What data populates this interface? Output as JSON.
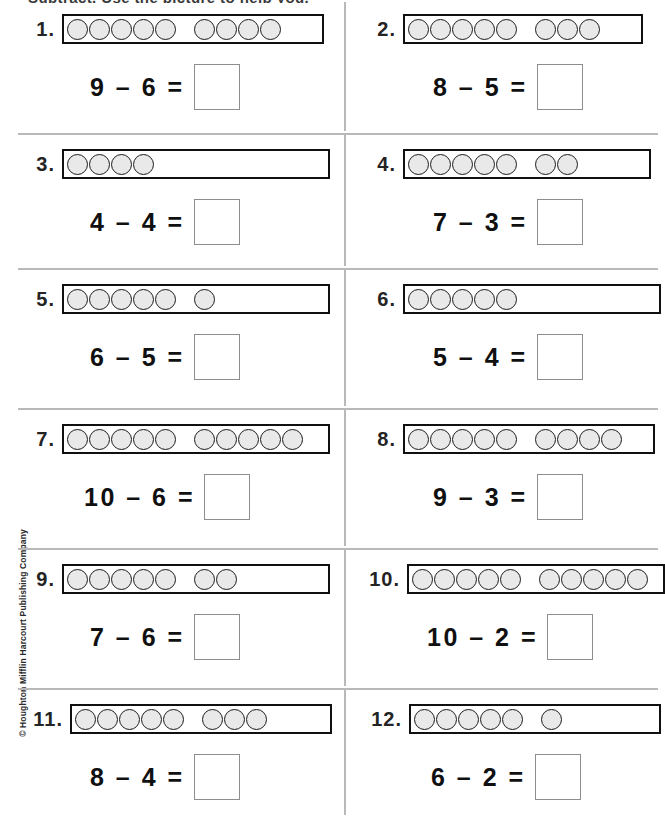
{
  "page": {
    "top_instruction_fragment": "Subtract. Use the picture to help you.",
    "copyright": "© Houghton Mifflin Harcourt Publishing Company",
    "colors": {
      "counter_fill": "#e9e9e9",
      "counter_stroke": "#1a1a1a",
      "strip_stroke": "#101010",
      "divider": "#b9b9b9",
      "answer_box_stroke": "#8d8d8d",
      "text": "#101010"
    }
  },
  "layout": {
    "columns": 2,
    "rows": 6,
    "row_divider_y": [
      133,
      268,
      408,
      548,
      688
    ],
    "column_divider_x": 344
  },
  "problems": [
    {
      "number": "1.",
      "strip_width": 262,
      "groups": [
        5,
        4
      ],
      "total_counters": 9,
      "equation": "9 – 6 =",
      "minuend": 9,
      "subtrahend": 6,
      "answer": "",
      "eq_left": 90,
      "strip_left": 18
    },
    {
      "number": "2.",
      "strip_width": 240,
      "groups": [
        5,
        3
      ],
      "total_counters": 8,
      "equation": "8 – 5 =",
      "minuend": 8,
      "subtrahend": 5,
      "answer": "",
      "eq_left": 88,
      "strip_left": 14
    },
    {
      "number": "3.",
      "strip_width": 268,
      "groups": [
        4
      ],
      "total_counters": 4,
      "equation": "4 – 4 =",
      "minuend": 4,
      "subtrahend": 4,
      "answer": "",
      "eq_left": 90,
      "strip_left": 18
    },
    {
      "number": "4.",
      "strip_width": 248,
      "groups": [
        5,
        2
      ],
      "total_counters": 7,
      "equation": "7 – 3 =",
      "minuend": 7,
      "subtrahend": 3,
      "answer": "",
      "eq_left": 88,
      "strip_left": 14
    },
    {
      "number": "5.",
      "strip_width": 268,
      "groups": [
        5,
        1
      ],
      "total_counters": 6,
      "equation": "6 – 5 =",
      "minuend": 6,
      "subtrahend": 5,
      "answer": "",
      "eq_left": 90,
      "strip_left": 18
    },
    {
      "number": "6.",
      "strip_width": 258,
      "groups": [
        5
      ],
      "total_counters": 5,
      "equation": "5 – 4 =",
      "minuend": 5,
      "subtrahend": 4,
      "answer": "",
      "eq_left": 88,
      "strip_left": 14
    },
    {
      "number": "7.",
      "strip_width": 268,
      "groups": [
        5,
        5
      ],
      "total_counters": 10,
      "equation": "10 – 6 =",
      "minuend": 10,
      "subtrahend": 6,
      "answer": "",
      "eq_left": 84,
      "strip_left": 18
    },
    {
      "number": "8.",
      "strip_width": 252,
      "groups": [
        5,
        4
      ],
      "total_counters": 9,
      "equation": "9 – 3 =",
      "minuend": 9,
      "subtrahend": 3,
      "answer": "",
      "eq_left": 88,
      "strip_left": 14
    },
    {
      "number": "9.",
      "strip_width": 268,
      "groups": [
        5,
        2
      ],
      "total_counters": 7,
      "equation": "7 – 6 =",
      "minuend": 7,
      "subtrahend": 6,
      "answer": "",
      "eq_left": 90,
      "strip_left": 18
    },
    {
      "number": "10.",
      "strip_width": 258,
      "groups": [
        5,
        5
      ],
      "total_counters": 10,
      "equation": "10 – 2 =",
      "minuend": 10,
      "subtrahend": 2,
      "answer": "",
      "eq_left": 82,
      "strip_left": 10
    },
    {
      "number": "11.",
      "strip_width": 262,
      "groups": [
        5,
        3
      ],
      "total_counters": 8,
      "equation": "8 – 4 =",
      "minuend": 8,
      "subtrahend": 4,
      "answer": "",
      "eq_left": 90,
      "strip_left": 18
    },
    {
      "number": "12.",
      "strip_width": 252,
      "groups": [
        5,
        1
      ],
      "total_counters": 6,
      "equation": "6 – 2 =",
      "minuend": 6,
      "subtrahend": 2,
      "answer": "",
      "eq_left": 86,
      "strip_left": 12
    }
  ]
}
